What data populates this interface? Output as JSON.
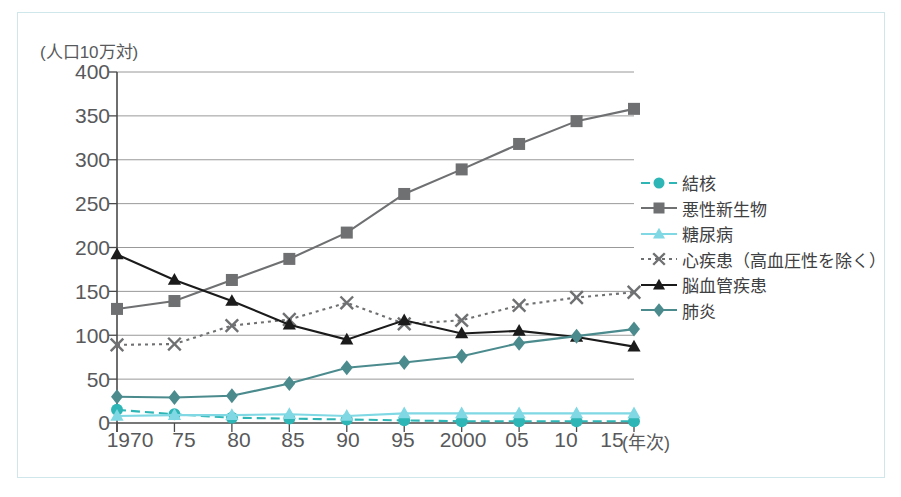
{
  "chart_data": {
    "type": "line",
    "title": "",
    "ylabel": "(人口10万対)",
    "xlabel": "(年次)",
    "ylim": [
      0,
      400
    ],
    "ytick_step": 50,
    "yticks": [
      "400",
      "350",
      "300",
      "250",
      "200",
      "150",
      "100",
      "50",
      "0"
    ],
    "categories": [
      "1970",
      "75",
      "80",
      "85",
      "90",
      "95",
      "2000",
      "05",
      "10",
      "15"
    ],
    "grid": true,
    "legend_position": "right",
    "series": [
      {
        "name": "結核",
        "color": "#2eb6b6",
        "marker": "circle",
        "line": "dashed",
        "values": [
          15,
          10,
          6,
          5,
          4,
          3,
          2,
          2,
          2,
          2
        ]
      },
      {
        "name": "悪性新生物",
        "color": "#6f7072",
        "marker": "square",
        "line": "solid",
        "values": [
          130,
          139,
          163,
          187,
          217,
          261,
          289,
          318,
          344,
          358
        ]
      },
      {
        "name": "糖尿病",
        "color": "#7fd8e3",
        "marker": "triangle",
        "line": "solid",
        "values": [
          8,
          9,
          9,
          10,
          8,
          11,
          11,
          11,
          11,
          11
        ]
      },
      {
        "name": "心疾患（高血圧性を除く）",
        "color": "#6f7072",
        "marker": "cross",
        "line": "dotted",
        "values": [
          89,
          90,
          111,
          118,
          137,
          113,
          117,
          134,
          143,
          149
        ]
      },
      {
        "name": "脳血管疾患",
        "color": "#1b1b1b",
        "marker": "triangle",
        "line": "solid",
        "values": [
          192,
          163,
          139,
          112,
          95,
          117,
          102,
          105,
          98,
          87
        ]
      },
      {
        "name": "肺炎",
        "color": "#4b8b8e",
        "marker": "diamond",
        "line": "solid",
        "values": [
          30,
          29,
          31,
          45,
          63,
          69,
          76,
          91,
          99,
          107
        ]
      }
    ]
  },
  "legend": {
    "items": [
      {
        "label": "結核"
      },
      {
        "label": "悪性新生物"
      },
      {
        "label": "糖尿病"
      },
      {
        "label": "心疾患（高血圧性を除く）"
      },
      {
        "label": "脳血管疾患"
      },
      {
        "label": "肺炎"
      }
    ]
  }
}
